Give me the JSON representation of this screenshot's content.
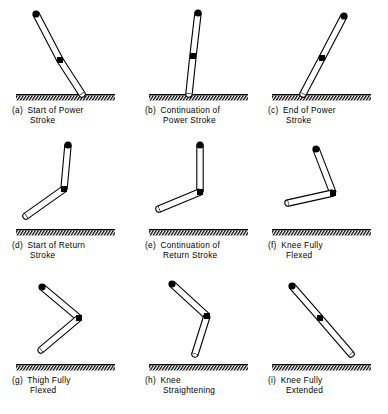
{
  "figure": {
    "type": "diagram",
    "rows": 3,
    "columns": 3,
    "ground_label": "hatched-ground-line",
    "markers": {
      "hip": "filled-circle",
      "knee": "filled-square",
      "foot": "open-rounded-end"
    },
    "colors": {
      "ink": "#000000",
      "background": "#ffffff",
      "limb_fill": "#ffffff"
    }
  },
  "panels": [
    {
      "id": "a",
      "tag": "(a)",
      "line1": "Start of  Power",
      "line2": "Stroke",
      "ground": true,
      "joints": {
        "hip": [
          30,
          12
        ],
        "knee": [
          54,
          58
        ],
        "foot": [
          76,
          92
        ]
      }
    },
    {
      "id": "b",
      "tag": "(b)",
      "line1": "Continuation of",
      "line2": "Power Stroke",
      "ground": true,
      "joints": {
        "hip": [
          59,
          11
        ],
        "knee": [
          54,
          54
        ],
        "foot": [
          50,
          92
        ]
      }
    },
    {
      "id": "c",
      "tag": "(c)",
      "line1": "End of Power",
      "line2": "Stroke",
      "ground": true,
      "joints": {
        "hip": [
          82,
          14
        ],
        "knee": [
          60,
          56
        ],
        "foot": [
          41,
          92
        ]
      }
    },
    {
      "id": "d",
      "tag": "(d)",
      "line1": "Start of Return",
      "line2": "Stroke",
      "ground": true,
      "joints": {
        "hip": [
          62,
          8
        ],
        "knee": [
          58,
          52
        ],
        "foot": [
          20,
          79
        ]
      }
    },
    {
      "id": "e",
      "tag": "(e)",
      "line1": "Continuation of",
      "line2": "Return Stroke",
      "ground": true,
      "joints": {
        "hip": [
          61,
          8
        ],
        "knee": [
          61,
          55
        ],
        "foot": [
          20,
          72
        ]
      }
    },
    {
      "id": "f",
      "tag": "(f)",
      "line1": "Knee Fully",
      "line2": "Flexed",
      "ground": true,
      "joints": {
        "hip": [
          54,
          12
        ],
        "knee": [
          71,
          56
        ],
        "foot": [
          26,
          66
        ]
      }
    },
    {
      "id": "g",
      "tag": "(g)",
      "line1": "Thigh Fully",
      "line2": "Flexed",
      "ground": true,
      "joints": {
        "hip": [
          36,
          15
        ],
        "knee": [
          73,
          46
        ],
        "foot": [
          35,
          78
        ]
      }
    },
    {
      "id": "h",
      "tag": "(h)",
      "line1": "Knee",
      "line2": "Straightening",
      "ground": true,
      "joints": {
        "hip": [
          33,
          12
        ],
        "knee": [
          68,
          44
        ],
        "foot": [
          56,
          82
        ]
      }
    },
    {
      "id": "i",
      "tag": "(i)",
      "line1": "Knee Fully",
      "line2": "Extended",
      "ground": true,
      "joints": {
        "hip": [
          30,
          14
        ],
        "knee": [
          58,
          46
        ],
        "foot": [
          89,
          82
        ]
      }
    }
  ]
}
